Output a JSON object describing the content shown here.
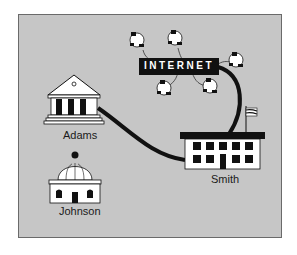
{
  "diagram": {
    "type": "network-diagram",
    "colors": {
      "background": "#c6c6c6",
      "border": "#6a6a6a",
      "ink": "#111111",
      "paper": "#ffffff"
    },
    "hub": {
      "label": "INTERNET"
    },
    "nodes": [
      {
        "id": "adams",
        "label": "Adams",
        "icon": "classical-building-icon"
      },
      {
        "id": "smith",
        "label": "Smith",
        "icon": "school-building-icon"
      },
      {
        "id": "johnson",
        "label": "Johnson",
        "icon": "domed-building-icon"
      }
    ],
    "connections": [
      {
        "from": "Adams",
        "to": "Smith"
      },
      {
        "from": "Smith",
        "to": "INTERNET"
      }
    ],
    "internet_computers": 6
  }
}
